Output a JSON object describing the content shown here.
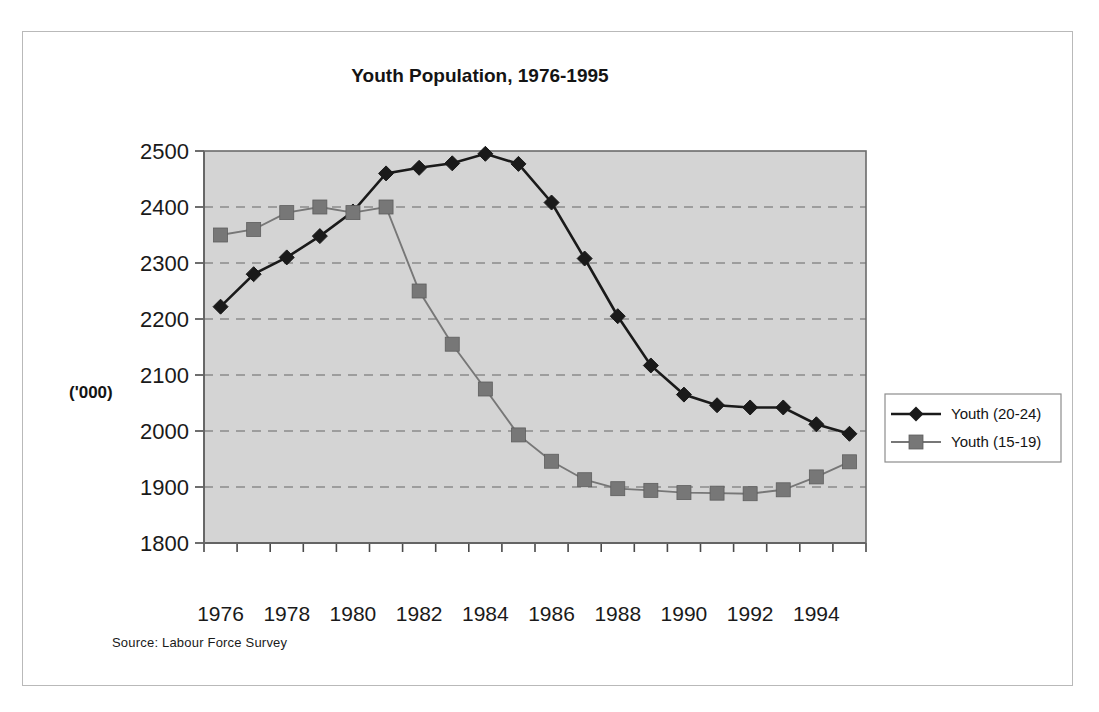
{
  "chart_data": {
    "type": "line",
    "title": "Youth Population, 1976-1995",
    "xlabel": "",
    "ylabel": "('000)",
    "ylim": [
      1800,
      2500
    ],
    "ytick_step": 100,
    "yticks": [
      1800,
      1900,
      2000,
      2100,
      2200,
      2300,
      2400,
      2500
    ],
    "grid": true,
    "legend_position": "right",
    "x": [
      1976,
      1977,
      1978,
      1979,
      1980,
      1981,
      1982,
      1983,
      1984,
      1985,
      1986,
      1987,
      1988,
      1989,
      1990,
      1991,
      1992,
      1993,
      1994,
      1995
    ],
    "xtick_labels": [
      "1976",
      "1978",
      "1980",
      "1982",
      "1984",
      "1986",
      "1988",
      "1990",
      "1992",
      "1994"
    ],
    "xtick_values": [
      1976,
      1978,
      1980,
      1982,
      1984,
      1986,
      1988,
      1990,
      1992,
      1994
    ],
    "series": [
      {
        "name": "Youth (20-24)",
        "marker": "diamond",
        "color": "#1a1a1a",
        "values": [
          2222,
          2280,
          2310,
          2348,
          2392,
          2460,
          2470,
          2478,
          2495,
          2477,
          2408,
          2308,
          2205,
          2117,
          2065,
          2046,
          2042,
          2042,
          2012,
          1995
        ]
      },
      {
        "name": "Youth (15-19)",
        "marker": "square",
        "color": "#777777",
        "values": [
          2350,
          2360,
          2390,
          2400,
          2390,
          2400,
          2250,
          2155,
          2075,
          1993,
          1946,
          1913,
          1897,
          1894,
          1890,
          1889,
          1888,
          1895,
          1918,
          1945
        ]
      }
    ],
    "source_note": "Source:  Labour Force Survey"
  },
  "figure": {
    "title": "Youth Population, 1976-1995",
    "y_unit_label": "('000)",
    "source_note": "Source:  Labour Force Survey",
    "legend": [
      {
        "label": "Youth (20-24)",
        "marker": "diamond-marker-icon",
        "color": "#1a1a1a"
      },
      {
        "label": "Youth (15-19)",
        "marker": "square-marker-icon",
        "color": "#777777"
      }
    ],
    "colors": {
      "plot_background": "#d4d4d4",
      "page_background": "#ffffff",
      "grid": "#8a8a8a",
      "axis": "#4a4a4a",
      "series_20_24": "#1a1a1a",
      "series_15_19": "#777777"
    }
  }
}
